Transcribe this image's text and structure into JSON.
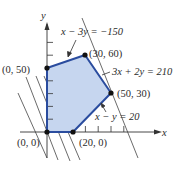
{
  "diagram": {
    "type": "feasible-region",
    "axes": {
      "x_label": "x",
      "y_label": "y"
    },
    "vertices": [
      {
        "label": "(0, 0)",
        "x": 0,
        "y": 0
      },
      {
        "label": "(20, 0)",
        "x": 20,
        "y": 0
      },
      {
        "label": "(50, 30)",
        "x": 50,
        "y": 30
      },
      {
        "label": "(30, 60)",
        "x": 30,
        "y": 60
      },
      {
        "label": "(0, 50)",
        "x": 0,
        "y": 50
      }
    ],
    "constraints": [
      {
        "label_lhs": "x − 3y",
        "label_rhs": "= −150",
        "text": "x − 3y = −150"
      },
      {
        "label_lhs": "3x + 2y",
        "label_rhs": "= 210",
        "text": "3x + 2y = 210"
      },
      {
        "label_lhs": "x − y",
        "label_rhs": "= 20",
        "text": "x − y = 20"
      }
    ],
    "colors": {
      "region_fill": "#c6d6ef",
      "region_edge": "#2a4c9e",
      "axis": "#333333",
      "level_lines": "#444444",
      "vertex": "#111111"
    }
  }
}
